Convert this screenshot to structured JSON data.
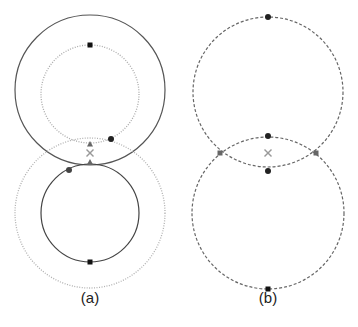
{
  "figure": {
    "panels": [
      {
        "id": "a",
        "label": "(a)",
        "label_pos": {
          "x": 90,
          "y": 298
        },
        "circles": [
          {
            "name": "outer-solid-top",
            "cx": 90,
            "cy": 90,
            "r": 75,
            "style": "solid",
            "color": "#555555"
          },
          {
            "name": "inner-dotted-top",
            "cx": 90,
            "cy": 94,
            "r": 49,
            "style": "dotted",
            "color": "#aaaaaa"
          },
          {
            "name": "inner-solid-bottom",
            "cx": 90,
            "cy": 213,
            "r": 49,
            "style": "solid",
            "color": "#444444"
          },
          {
            "name": "outer-dotted-bottom",
            "cx": 90,
            "cy": 213,
            "r": 75,
            "style": "dotted",
            "color": "#b0b0b0"
          }
        ],
        "markers": [
          {
            "type": "square",
            "x": 90,
            "y": 45,
            "color": "#111111"
          },
          {
            "type": "square",
            "x": 90,
            "y": 262,
            "color": "#111111"
          },
          {
            "type": "dot",
            "x": 111,
            "y": 139,
            "color": "#222222"
          },
          {
            "type": "dot",
            "x": 69,
            "y": 170,
            "color": "#444444"
          },
          {
            "type": "triangle",
            "x": 90,
            "y": 144,
            "color": "#666666"
          },
          {
            "type": "triangle",
            "x": 90,
            "y": 162,
            "color": "#666666"
          },
          {
            "type": "cross",
            "x": 90,
            "y": 153,
            "color": "#999999"
          }
        ]
      },
      {
        "id": "b",
        "label": "(b)",
        "label_pos": {
          "x": 268,
          "y": 298
        },
        "circles": [
          {
            "name": "upper-dashed",
            "cx": 268,
            "cy": 92,
            "r": 75,
            "style": "dashed",
            "color": "#666666"
          },
          {
            "name": "lower-dashed",
            "cx": 268,
            "cy": 213,
            "r": 76,
            "style": "dashed",
            "color": "#666666"
          }
        ],
        "markers": [
          {
            "type": "dot",
            "x": 268,
            "y": 17,
            "color": "#222222"
          },
          {
            "type": "dot",
            "x": 268,
            "y": 136,
            "color": "#222222"
          },
          {
            "type": "dot",
            "x": 268,
            "y": 171,
            "color": "#222222"
          },
          {
            "type": "square",
            "x": 268,
            "y": 289,
            "color": "#111111"
          },
          {
            "type": "square",
            "x": 220,
            "y": 153,
            "color": "#666666"
          },
          {
            "type": "square",
            "x": 316,
            "y": 153,
            "color": "#666666"
          },
          {
            "type": "cross",
            "x": 268,
            "y": 153,
            "color": "#999999"
          }
        ]
      }
    ]
  }
}
